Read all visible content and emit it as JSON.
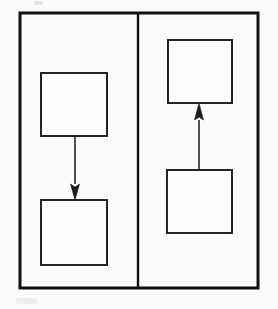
{
  "figure": {
    "width": 278,
    "height": 309,
    "background_color": "#fbfbfa",
    "stroke_color": "#1a1a1a",
    "frame_color": "#111111",
    "box_fill_color": "#fefefe"
  },
  "frame": {
    "x": 20,
    "y": 13,
    "width": 238,
    "height": 275,
    "stroke_width": 3
  },
  "divider": {
    "x": 138,
    "y_top": 13,
    "y_bottom": 288,
    "stroke_width": 2.4
  },
  "panels": [
    {
      "id": "panel-left",
      "name": "left-panel",
      "label": "",
      "x": 20,
      "y": 13,
      "width": 118,
      "height": 275,
      "flow_direction": "downward",
      "nodes": [
        {
          "id": "left-top-box",
          "name": "left-top-box",
          "label": "",
          "x": 41,
          "y": 73,
          "width": 66,
          "height": 63
        },
        {
          "id": "left-bottom-box",
          "name": "left-bottom-box",
          "label": "",
          "x": 41,
          "y": 200,
          "width": 66,
          "height": 65
        }
      ],
      "edges": [
        {
          "id": "left-edge",
          "name": "left-downward-arrow",
          "label": "",
          "from": "left-top-box",
          "to": "left-bottom-box",
          "direction": "down",
          "x": 75,
          "y_start": 136,
          "y_end": 200,
          "head_length": 16,
          "head_width": 9
        }
      ]
    },
    {
      "id": "panel-right",
      "name": "right-panel",
      "label": "",
      "x": 138,
      "y": 13,
      "width": 120,
      "height": 275,
      "flow_direction": "upward",
      "nodes": [
        {
          "id": "right-top-box",
          "name": "right-top-box",
          "label": "",
          "x": 168,
          "y": 40,
          "width": 64,
          "height": 63
        },
        {
          "id": "right-bottom-box",
          "name": "right-bottom-box",
          "label": "",
          "x": 167,
          "y": 170,
          "width": 65,
          "height": 63
        }
      ],
      "edges": [
        {
          "id": "right-edge",
          "name": "right-upward-arrow",
          "label": "",
          "from": "right-bottom-box",
          "to": "right-top-box",
          "direction": "up",
          "x": 199,
          "y_start": 170,
          "y_end": 103,
          "head_length": 17,
          "head_width": 9
        }
      ]
    }
  ],
  "artifacts": [
    {
      "id": "smudge-top",
      "name": "scan-smudge-top",
      "x": 34,
      "y": 1,
      "width": 9,
      "height": 4,
      "kind": "strong"
    },
    {
      "id": "smudge-bottom-left",
      "name": "scan-smudge-bottom-left",
      "x": 16,
      "y": 298,
      "width": 22,
      "height": 6,
      "kind": "faint"
    }
  ]
}
